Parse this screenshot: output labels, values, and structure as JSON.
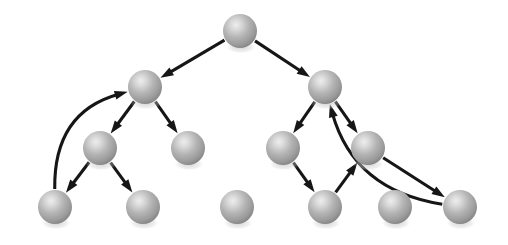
{
  "figure": {
    "background_color": "#ffffff",
    "width": 508,
    "height": 245
  },
  "style": {
    "node_radius": 17,
    "node_fill_highlight": "#e9e9e9",
    "node_fill_mid": "#a8a8a8",
    "node_fill_edge": "#7e7e7e",
    "node_shadow_color": "#bdbdbd",
    "edge_color": "#161616",
    "edge_width": 3.1,
    "arrow_length": 13,
    "arrow_width": 9
  },
  "graph": {
    "node_count": 12,
    "edge_count": 13,
    "nodes": [
      {
        "id": "n0",
        "label": "root",
        "x": 240,
        "y": 31,
        "level": 1
      },
      {
        "id": "n1",
        "label": "left-child",
        "x": 145,
        "y": 87,
        "level": 2
      },
      {
        "id": "n2",
        "label": "right-child",
        "x": 325,
        "y": 87,
        "level": 2
      },
      {
        "id": "n3",
        "label": "left-inner",
        "x": 100,
        "y": 148,
        "level": 3
      },
      {
        "id": "n4",
        "label": "left-outer",
        "x": 188,
        "y": 148,
        "level": 3
      },
      {
        "id": "n5",
        "label": "right-inner",
        "x": 283,
        "y": 148,
        "level": 3
      },
      {
        "id": "n6",
        "label": "right-outer",
        "x": 368,
        "y": 148,
        "level": 3
      },
      {
        "id": "n7",
        "label": "leaf-1",
        "x": 55,
        "y": 207,
        "level": 4
      },
      {
        "id": "n8",
        "label": "leaf-2",
        "x": 143,
        "y": 207,
        "level": 4
      },
      {
        "id": "n9",
        "label": "leaf-3-isolated",
        "x": 237,
        "y": 207,
        "level": 4
      },
      {
        "id": "n10",
        "label": "leaf-4",
        "x": 325,
        "y": 207,
        "level": 4
      },
      {
        "id": "n11",
        "label": "leaf-5-isolated",
        "x": 395,
        "y": 207,
        "level": 4
      },
      {
        "id": "n12",
        "label": "leaf-6",
        "x": 460,
        "y": 207,
        "level": 4
      }
    ],
    "edges": [
      {
        "id": "e1",
        "from": "n0",
        "to": "n1",
        "kind": "straight"
      },
      {
        "id": "e2",
        "from": "n0",
        "to": "n2",
        "kind": "straight"
      },
      {
        "id": "e3",
        "from": "n1",
        "to": "n3",
        "kind": "straight"
      },
      {
        "id": "e4",
        "from": "n1",
        "to": "n4",
        "kind": "straight"
      },
      {
        "id": "e5",
        "from": "n3",
        "to": "n7",
        "kind": "straight"
      },
      {
        "id": "e6",
        "from": "n3",
        "to": "n8",
        "kind": "straight"
      },
      {
        "id": "e7",
        "from": "n2",
        "to": "n5",
        "kind": "straight"
      },
      {
        "id": "e8",
        "from": "n2",
        "to": "n6",
        "kind": "straight"
      },
      {
        "id": "e9",
        "from": "n5",
        "to": "n10",
        "kind": "straight"
      },
      {
        "id": "e10",
        "from": "n10",
        "to": "n6",
        "kind": "straight"
      },
      {
        "id": "e11",
        "from": "n6",
        "to": "n12",
        "kind": "straight"
      },
      {
        "id": "e12",
        "from": "n7",
        "to": "n1",
        "kind": "curved",
        "bow": -58
      },
      {
        "id": "e13",
        "from": "n12",
        "to": "n2",
        "kind": "curved",
        "bow": -58
      }
    ]
  }
}
